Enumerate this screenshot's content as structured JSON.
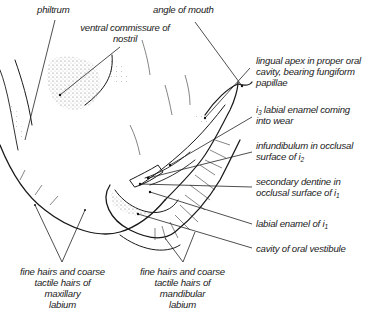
{
  "figure": {
    "labels": {
      "philtrum": "philtrum",
      "ventral_commissure": [
        "ventral commissure of",
        "nostril"
      ],
      "angle_of_mouth": "angle of mouth",
      "lingual_apex": [
        "lingual apex in proper oral",
        "cavity, bearing fungiform",
        "papillae"
      ],
      "i3_labial_enamel": {
        "pre": "i",
        "sub": "3",
        "post": " labial enamel coming",
        "line2": "into wear"
      },
      "infundibulum": {
        "line1": "infundibulum in occlusal",
        "pre": "surface of i",
        "sub": "2"
      },
      "secondary_dentine": {
        "line1": "secondary dentine in",
        "pre": "occlusal surface of i",
        "sub": "1"
      },
      "labial_enamel_i1": {
        "pre": "labial enamel of i",
        "sub": "1"
      },
      "oral_vestibule": "cavity of oral vestibule",
      "maxillary_hairs": [
        "fine hairs and coarse",
        "tactile hairs of",
        "maxillary",
        "labium"
      ],
      "mandibular_hairs": [
        "fine hairs and coarse",
        "tactile hairs of",
        "mandibular",
        "labium"
      ]
    }
  }
}
